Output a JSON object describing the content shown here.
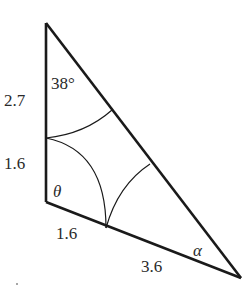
{
  "figure": {
    "type": "geometry-triangle",
    "vertices": {
      "top": {
        "x": 46,
        "y": 23
      },
      "right_angle": {
        "x": 46,
        "y": 202
      },
      "right": {
        "x": 241,
        "y": 278
      }
    },
    "side_labels": {
      "vertical_upper": "2.7",
      "vertical_lower": "1.6",
      "base_left": "1.6",
      "base_right": "3.6"
    },
    "angle_labels": {
      "top": "38°",
      "right_angle": "θ",
      "right": "α"
    },
    "colors": {
      "stroke": "#1a1a1a",
      "text": "#2a2a2a",
      "background": "#ffffff"
    }
  }
}
